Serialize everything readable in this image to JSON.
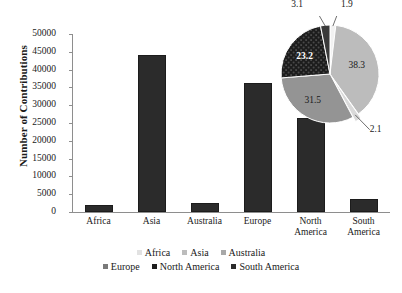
{
  "chart_data": {
    "type": "bar",
    "title": "",
    "xlabel": "",
    "ylabel": "Number of Contributions",
    "categories": [
      "Africa",
      "Asia",
      "Australia",
      "Europe",
      "North America",
      "South America"
    ],
    "category_lines": [
      [
        "Africa"
      ],
      [
        "Asia"
      ],
      [
        "Australia"
      ],
      [
        "Europe"
      ],
      [
        "North",
        "America"
      ],
      [
        "South",
        "America"
      ]
    ],
    "values": [
      2100,
      44000,
      2400,
      36100,
      26500,
      3600
    ],
    "ylim": [
      0,
      50000
    ],
    "yticks": [
      0,
      5000,
      10000,
      15000,
      20000,
      25000,
      30000,
      35000,
      40000,
      45000,
      50000
    ],
    "ytick_labels": [
      "0",
      "5000",
      "10000",
      "15000",
      "20000",
      "25000",
      "30000",
      "35000",
      "40000",
      "45000",
      "50000"
    ],
    "grid": false,
    "bar_color": "#2b2b2b",
    "inset_pie": {
      "type": "pie",
      "labels": [
        "Africa",
        "Asia",
        "Australia",
        "Europe",
        "North America",
        "South America"
      ],
      "values": [
        1.9,
        38.3,
        2.1,
        31.5,
        23.2,
        3.1
      ],
      "value_labels": [
        "1.9",
        "38.3",
        "2.1",
        "31.5",
        "23.2",
        "3.1"
      ],
      "colors": [
        "#f2f2f2",
        "#bcbcbc",
        "#d9d9d9",
        "#949494",
        "#1d1d1d",
        "#3a3a3a"
      ],
      "exploded": [
        "Australia"
      ]
    },
    "legend": {
      "position": "bottom",
      "rows": [
        [
          {
            "label": "Africa",
            "color": "#e2e2e2"
          },
          {
            "label": "Asia",
            "color": "#bcbcbc"
          },
          {
            "label": "Australia",
            "color": "#a8a8a8"
          }
        ],
        [
          {
            "label": "Europe",
            "color": "#7a7a7a"
          },
          {
            "label": "North America",
            "color": "#1d1d1d"
          },
          {
            "label": "South America",
            "color": "#2b2b2b"
          }
        ]
      ]
    }
  }
}
